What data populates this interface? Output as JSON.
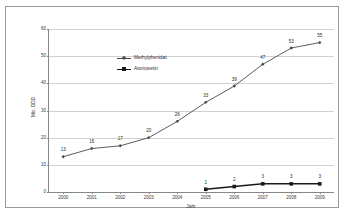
{
  "chart_data": {
    "type": "line",
    "title": "",
    "xlabel": "Jahr",
    "ylabel": "Mio. DDD",
    "categories": [
      "2000",
      "2001",
      "2002",
      "2003",
      "2004",
      "2005",
      "2006",
      "2007",
      "2008",
      "2009"
    ],
    "ylim": [
      0,
      60
    ],
    "yticks": [
      0,
      10,
      20,
      30,
      40,
      50,
      60
    ],
    "ytick_labels": [
      "0",
      "10",
      "20",
      "30",
      "40",
      "50",
      "60"
    ],
    "grid": "horizontal",
    "legend_position": "upper-left-inside",
    "series": [
      {
        "name": "Methylphenidat",
        "marker": "diamond",
        "color": "#4a4a4a",
        "values": [
          13,
          16,
          17,
          20,
          26,
          33,
          39,
          47,
          53,
          55
        ],
        "labels": [
          "13",
          "16",
          "17",
          "20",
          "26",
          "33",
          "39",
          "47",
          "53",
          "55"
        ]
      },
      {
        "name": "Atomoxetin",
        "marker": "square",
        "color": "#1a1a1a",
        "values": [
          null,
          null,
          null,
          null,
          null,
          1,
          2,
          3,
          3,
          3
        ],
        "labels": [
          "",
          "",
          "",
          "",
          "",
          "1",
          "2",
          "3",
          "3",
          "3"
        ]
      }
    ]
  },
  "legend": {
    "items": [
      {
        "label": "Methylphenidat"
      },
      {
        "label": "Atomoxetin"
      }
    ]
  },
  "axes": {
    "x_title": "Jahr",
    "y_title": "Mio. DDD"
  }
}
